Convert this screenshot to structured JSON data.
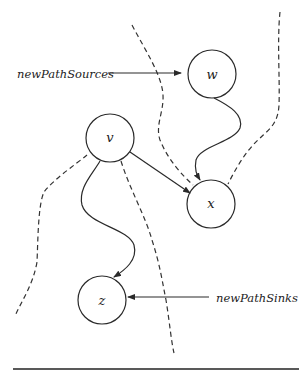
{
  "diagram": {
    "nodes": [
      {
        "id": "w",
        "label": "w",
        "cx": 212,
        "cy": 74,
        "r": 24
      },
      {
        "id": "v",
        "label": "v",
        "cx": 110,
        "cy": 138,
        "r": 24
      },
      {
        "id": "x",
        "label": "x",
        "cx": 211,
        "cy": 204,
        "r": 24
      },
      {
        "id": "z",
        "label": "z",
        "cx": 102,
        "cy": 300,
        "r": 24
      }
    ],
    "edges": [
      {
        "from": "v",
        "to": "x",
        "style": "straight-arrow"
      },
      {
        "from": "w",
        "to": "x",
        "style": "curved-arrow"
      },
      {
        "from": "v",
        "to": "z",
        "style": "curved-arrow"
      }
    ],
    "annotations": {
      "sources": {
        "label": "newPathSources",
        "points_to": "w"
      },
      "sinks": {
        "label": "newPathSinks",
        "points_to": "z"
      }
    },
    "dashed_cuts": 4,
    "colors": {
      "stroke": "#2a2a2a",
      "background": "#ffffff"
    }
  }
}
